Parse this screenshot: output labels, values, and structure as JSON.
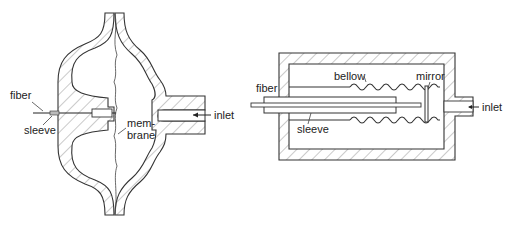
{
  "diagrams": [
    {
      "id": "membrane-sensor",
      "labels": {
        "fiber": "fiber",
        "sleeve": "sleeve",
        "membrane_line1": "mem-",
        "membrane_line2": "brane",
        "inlet": "inlet"
      }
    },
    {
      "id": "bellow-sensor",
      "labels": {
        "fiber": "fiber",
        "bellow": "bellow",
        "mirror": "mirror",
        "sleeve": "sleeve",
        "inlet": "inlet"
      }
    }
  ],
  "colors": {
    "line": "#333333",
    "hatch": "#666666",
    "background": "#ffffff"
  }
}
